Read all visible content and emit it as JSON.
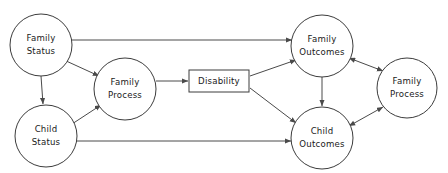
{
  "diagram": {
    "background_color": "#ffffff",
    "stroke_color": "#3c3c3c",
    "edge_color": "#4a4a4a",
    "text_color": "#1a1a1a",
    "nodes": [
      {
        "id": "family-status",
        "shape": "circle",
        "label_line1": "Family",
        "label_line2": "Status",
        "cx": 41,
        "cy": 45,
        "r": 31
      },
      {
        "id": "child-status",
        "shape": "circle",
        "label_line1": "Child",
        "label_line2": "Status",
        "cx": 46,
        "cy": 136,
        "r": 31
      },
      {
        "id": "family-process-left",
        "shape": "circle",
        "label_line1": "Family",
        "label_line2": "Process",
        "cx": 125,
        "cy": 89,
        "r": 31
      },
      {
        "id": "disability",
        "shape": "rect",
        "label_line1": "Disability",
        "label_line2": "",
        "x": 189,
        "y": 70,
        "w": 60,
        "h": 22
      },
      {
        "id": "family-outcomes",
        "shape": "circle",
        "label_line1": "Family",
        "label_line2": "Outcomes",
        "cx": 322,
        "cy": 46,
        "r": 31
      },
      {
        "id": "child-outcomes",
        "shape": "circle",
        "label_line1": "Child",
        "label_line2": "Outcomes",
        "cx": 322,
        "cy": 138,
        "r": 31
      },
      {
        "id": "family-process-right",
        "shape": "circle",
        "label_line1": "Family",
        "label_line2": "Process",
        "cx": 407,
        "cy": 88,
        "r": 30
      }
    ],
    "edges": [
      {
        "id": "family-status-to-family-outcomes",
        "from": "family-status",
        "to": "family-outcomes",
        "arrows": "end",
        "x1": 68,
        "y1": 40,
        "x2": 292,
        "y2": 40
      },
      {
        "id": "family-status-to-family-process",
        "from": "family-status",
        "to": "family-process-left",
        "arrows": "end",
        "x1": 64,
        "y1": 60,
        "x2": 99,
        "y2": 76
      },
      {
        "id": "family-status-to-child-status",
        "from": "family-status",
        "to": "child-status",
        "arrows": "end",
        "x1": 41,
        "y1": 76,
        "x2": 43,
        "y2": 104
      },
      {
        "id": "child-status-to-family-process",
        "from": "child-status",
        "to": "family-process-left",
        "arrows": "end",
        "x1": 72,
        "y1": 124,
        "x2": 101,
        "y2": 105
      },
      {
        "id": "child-status-to-child-outcomes",
        "from": "child-status",
        "to": "child-outcomes",
        "arrows": "end",
        "x1": 75,
        "y1": 141,
        "x2": 291,
        "y2": 141
      },
      {
        "id": "family-process-to-disability",
        "from": "family-process-left",
        "to": "disability",
        "arrows": "end",
        "x1": 156,
        "y1": 81,
        "x2": 188,
        "y2": 81
      },
      {
        "id": "disability-to-family-outcomes",
        "from": "disability",
        "to": "family-outcomes",
        "arrows": "end",
        "x1": 250,
        "y1": 76,
        "x2": 296,
        "y2": 60
      },
      {
        "id": "disability-to-child-outcomes",
        "from": "disability",
        "to": "child-outcomes",
        "arrows": "end",
        "x1": 250,
        "y1": 88,
        "x2": 296,
        "y2": 123
      },
      {
        "id": "family-outcomes-to-child-outcomes",
        "from": "family-outcomes",
        "to": "child-outcomes",
        "arrows": "end",
        "x1": 322,
        "y1": 77,
        "x2": 322,
        "y2": 106
      },
      {
        "id": "family-outcomes-family-process-right",
        "from": "family-outcomes",
        "to": "family-process-right",
        "arrows": "both",
        "x1": 349,
        "y1": 58,
        "x2": 383,
        "y2": 71
      },
      {
        "id": "child-outcomes-family-process-right",
        "from": "child-outcomes",
        "to": "family-process-right",
        "arrows": "both",
        "x1": 349,
        "y1": 126,
        "x2": 383,
        "y2": 107
      }
    ]
  }
}
